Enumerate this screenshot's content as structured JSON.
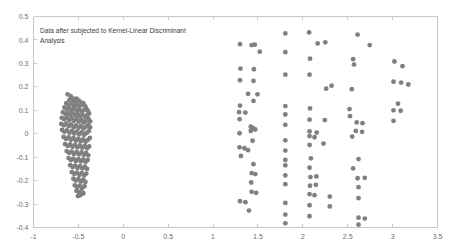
{
  "chart_data": {
    "type": "scatter",
    "title": "",
    "annotation": "Data after subjected to Kernel-Linear Discriminant Analysis",
    "annotation_line1": "Data after subjected to Kernel-Linear Discriminant",
    "annotation_line2": "Analysis",
    "xlabel": "",
    "ylabel": "",
    "xlim": [
      -1,
      3.5
    ],
    "ylim": [
      -0.4,
      0.5
    ],
    "xticks": [
      -1,
      -0.5,
      0,
      0.5,
      1,
      1.5,
      2,
      2.5,
      3,
      3.5
    ],
    "xticklabels": [
      "-1",
      "-0.5",
      "0",
      "0.5",
      "1",
      "1.5",
      "2",
      "2.5",
      "3",
      "3.5"
    ],
    "yticks": [
      -0.4,
      -0.3,
      -0.2,
      -0.1,
      0,
      0.1,
      0.2,
      0.3,
      0.4,
      0.5
    ],
    "yticklabels": [
      "-0.4",
      "-0.3",
      "-0.2",
      "-0.1",
      "0",
      "0.1",
      "0.2",
      "0.3",
      "0.4",
      "0.5"
    ],
    "grid": false,
    "legend": false,
    "marker_color": "#808080",
    "marker_size": 2.4,
    "frame_color": "#c8c8c8",
    "background_color": "#ffffff",
    "series": [
      {
        "name": "class-1-dense-cluster",
        "color": "#808080",
        "points": [
          [
            -0.62,
            0.168
          ],
          [
            -0.585,
            0.16
          ],
          [
            -0.56,
            0.15
          ],
          [
            -0.6,
            0.143
          ],
          [
            -0.545,
            0.138
          ],
          [
            -0.52,
            0.15
          ],
          [
            -0.495,
            0.141
          ],
          [
            -0.47,
            0.133
          ],
          [
            -0.635,
            0.13
          ],
          [
            -0.61,
            0.122
          ],
          [
            -0.575,
            0.128
          ],
          [
            -0.55,
            0.118
          ],
          [
            -0.52,
            0.126
          ],
          [
            -0.495,
            0.117
          ],
          [
            -0.468,
            0.122
          ],
          [
            -0.445,
            0.13
          ],
          [
            -0.425,
            0.118
          ],
          [
            -0.655,
            0.112
          ],
          [
            -0.628,
            0.105
          ],
          [
            -0.6,
            0.11
          ],
          [
            -0.572,
            0.1
          ],
          [
            -0.545,
            0.108
          ],
          [
            -0.518,
            0.098
          ],
          [
            -0.492,
            0.104
          ],
          [
            -0.465,
            0.096
          ],
          [
            -0.44,
            0.101
          ],
          [
            -0.415,
            0.109
          ],
          [
            -0.395,
            0.098
          ],
          [
            -0.672,
            0.092
          ],
          [
            -0.645,
            0.085
          ],
          [
            -0.618,
            0.09
          ],
          [
            -0.59,
            0.08
          ],
          [
            -0.563,
            0.087
          ],
          [
            -0.536,
            0.078
          ],
          [
            -0.508,
            0.083
          ],
          [
            -0.482,
            0.075
          ],
          [
            -0.455,
            0.081
          ],
          [
            -0.428,
            0.072
          ],
          [
            -0.402,
            0.079
          ],
          [
            -0.382,
            0.087
          ],
          [
            -0.685,
            0.068
          ],
          [
            -0.658,
            0.062
          ],
          [
            -0.63,
            0.07
          ],
          [
            -0.602,
            0.058
          ],
          [
            -0.575,
            0.065
          ],
          [
            -0.548,
            0.055
          ],
          [
            -0.52,
            0.062
          ],
          [
            -0.494,
            0.052
          ],
          [
            -0.466,
            0.058
          ],
          [
            -0.44,
            0.048
          ],
          [
            -0.412,
            0.056
          ],
          [
            -0.388,
            0.064
          ],
          [
            -0.368,
            0.053
          ],
          [
            -0.69,
            0.042
          ],
          [
            -0.662,
            0.036
          ],
          [
            -0.635,
            0.044
          ],
          [
            -0.608,
            0.032
          ],
          [
            -0.58,
            0.04
          ],
          [
            -0.552,
            0.028
          ],
          [
            -0.525,
            0.036
          ],
          [
            -0.498,
            0.025
          ],
          [
            -0.47,
            0.033
          ],
          [
            -0.443,
            0.022
          ],
          [
            -0.416,
            0.03
          ],
          [
            -0.39,
            0.038
          ],
          [
            -0.37,
            0.027
          ],
          [
            -0.682,
            0.016
          ],
          [
            -0.655,
            0.008
          ],
          [
            -0.628,
            0.014
          ],
          [
            -0.6,
            0.004
          ],
          [
            -0.572,
            0.012
          ],
          [
            -0.545,
            0.001
          ],
          [
            -0.518,
            0.009
          ],
          [
            -0.492,
            -0.002
          ],
          [
            -0.464,
            0.006
          ],
          [
            -0.437,
            -0.005
          ],
          [
            -0.41,
            0.003
          ],
          [
            -0.384,
            0.011
          ],
          [
            -0.665,
            -0.014
          ],
          [
            -0.638,
            -0.022
          ],
          [
            -0.61,
            -0.016
          ],
          [
            -0.583,
            -0.026
          ],
          [
            -0.556,
            -0.018
          ],
          [
            -0.528,
            -0.029
          ],
          [
            -0.5,
            -0.021
          ],
          [
            -0.474,
            -0.032
          ],
          [
            -0.447,
            -0.024
          ],
          [
            -0.42,
            -0.034
          ],
          [
            -0.394,
            -0.026
          ],
          [
            -0.372,
            -0.018
          ],
          [
            -0.648,
            -0.044
          ],
          [
            -0.62,
            -0.052
          ],
          [
            -0.592,
            -0.046
          ],
          [
            -0.565,
            -0.056
          ],
          [
            -0.538,
            -0.048
          ],
          [
            -0.51,
            -0.058
          ],
          [
            -0.484,
            -0.05
          ],
          [
            -0.457,
            -0.06
          ],
          [
            -0.43,
            -0.052
          ],
          [
            -0.404,
            -0.062
          ],
          [
            -0.38,
            -0.054
          ],
          [
            -0.63,
            -0.074
          ],
          [
            -0.602,
            -0.082
          ],
          [
            -0.575,
            -0.076
          ],
          [
            -0.548,
            -0.086
          ],
          [
            -0.52,
            -0.078
          ],
          [
            -0.493,
            -0.088
          ],
          [
            -0.466,
            -0.08
          ],
          [
            -0.44,
            -0.09
          ],
          [
            -0.414,
            -0.082
          ],
          [
            -0.39,
            -0.092
          ],
          [
            -0.61,
            -0.104
          ],
          [
            -0.583,
            -0.112
          ],
          [
            -0.556,
            -0.106
          ],
          [
            -0.528,
            -0.116
          ],
          [
            -0.5,
            -0.108
          ],
          [
            -0.473,
            -0.118
          ],
          [
            -0.446,
            -0.11
          ],
          [
            -0.42,
            -0.12
          ],
          [
            -0.396,
            -0.112
          ],
          [
            -0.592,
            -0.134
          ],
          [
            -0.564,
            -0.142
          ],
          [
            -0.537,
            -0.136
          ],
          [
            -0.51,
            -0.146
          ],
          [
            -0.482,
            -0.138
          ],
          [
            -0.455,
            -0.148
          ],
          [
            -0.428,
            -0.14
          ],
          [
            -0.404,
            -0.15
          ],
          [
            -0.572,
            -0.164
          ],
          [
            -0.545,
            -0.172
          ],
          [
            -0.518,
            -0.166
          ],
          [
            -0.49,
            -0.176
          ],
          [
            -0.463,
            -0.168
          ],
          [
            -0.436,
            -0.178
          ],
          [
            -0.412,
            -0.17
          ],
          [
            -0.556,
            -0.192
          ],
          [
            -0.528,
            -0.2
          ],
          [
            -0.5,
            -0.194
          ],
          [
            -0.473,
            -0.204
          ],
          [
            -0.446,
            -0.196
          ],
          [
            -0.422,
            -0.206
          ],
          [
            -0.54,
            -0.22
          ],
          [
            -0.512,
            -0.228
          ],
          [
            -0.485,
            -0.222
          ],
          [
            -0.458,
            -0.232
          ],
          [
            -0.432,
            -0.224
          ],
          [
            -0.52,
            -0.244
          ],
          [
            -0.494,
            -0.25
          ],
          [
            -0.468,
            -0.246
          ],
          [
            -0.444,
            -0.254
          ],
          [
            -0.505,
            -0.266
          ],
          [
            -0.478,
            -0.262
          ]
        ]
      },
      {
        "name": "class-2-sparse-cluster",
        "color": "#808080",
        "points": [
          [
            1.805,
            0.428
          ],
          [
            2.07,
            0.432
          ],
          [
            2.61,
            0.423
          ],
          [
            1.3,
            0.382
          ],
          [
            1.43,
            0.378
          ],
          [
            1.465,
            0.38
          ],
          [
            2.165,
            0.385
          ],
          [
            2.25,
            0.39
          ],
          [
            2.745,
            0.378
          ],
          [
            1.52,
            0.35
          ],
          [
            1.805,
            0.348
          ],
          [
            2.08,
            0.32
          ],
          [
            2.56,
            0.318
          ],
          [
            3.02,
            0.308
          ],
          [
            2.57,
            0.295
          ],
          [
            3.11,
            0.288
          ],
          [
            1.305,
            0.278
          ],
          [
            1.455,
            0.275
          ],
          [
            1.805,
            0.252
          ],
          [
            2.075,
            0.252
          ],
          [
            1.3,
            0.228
          ],
          [
            1.45,
            0.225
          ],
          [
            3.01,
            0.222
          ],
          [
            3.095,
            0.218
          ],
          [
            3.175,
            0.21
          ],
          [
            2.32,
            0.205
          ],
          [
            2.26,
            0.192
          ],
          [
            2.545,
            0.19
          ],
          [
            1.39,
            0.17
          ],
          [
            1.495,
            0.168
          ],
          [
            1.45,
            0.14
          ],
          [
            1.3,
            0.12
          ],
          [
            1.805,
            0.118
          ],
          [
            3.06,
            0.128
          ],
          [
            2.08,
            0.108
          ],
          [
            2.52,
            0.105
          ],
          [
            3.01,
            0.1
          ],
          [
            3.09,
            0.098
          ],
          [
            1.29,
            0.092
          ],
          [
            1.36,
            0.09
          ],
          [
            1.805,
            0.082
          ],
          [
            2.525,
            0.075
          ],
          [
            1.295,
            0.062
          ],
          [
            2.075,
            0.06
          ],
          [
            2.245,
            0.058
          ],
          [
            3.01,
            0.055
          ],
          [
            2.6,
            0.048
          ],
          [
            2.665,
            0.045
          ],
          [
            1.805,
            0.038
          ],
          [
            1.42,
            0.03
          ],
          [
            1.445,
            0.025
          ],
          [
            1.42,
            0.012
          ],
          [
            1.47,
            0.018
          ],
          [
            2.075,
            0.01
          ],
          [
            2.155,
            0.005
          ],
          [
            2.59,
            0.012
          ],
          [
            2.66,
            0.008
          ],
          [
            1.295,
            0.002
          ],
          [
            2.075,
            -0.01
          ],
          [
            2.13,
            -0.015
          ],
          [
            2.55,
            -0.012
          ],
          [
            1.44,
            -0.03
          ],
          [
            1.805,
            -0.028
          ],
          [
            2.075,
            -0.048
          ],
          [
            2.23,
            -0.042
          ],
          [
            1.295,
            -0.058
          ],
          [
            1.35,
            -0.062
          ],
          [
            1.39,
            -0.07
          ],
          [
            1.805,
            -0.072
          ],
          [
            1.31,
            -0.095
          ],
          [
            1.805,
            -0.112
          ],
          [
            2.09,
            -0.105
          ],
          [
            2.62,
            -0.108
          ],
          [
            1.45,
            -0.13
          ],
          [
            1.805,
            -0.135
          ],
          [
            2.075,
            -0.145
          ],
          [
            2.56,
            -0.148
          ],
          [
            1.43,
            -0.168
          ],
          [
            1.47,
            -0.172
          ],
          [
            1.805,
            -0.178
          ],
          [
            2.085,
            -0.185
          ],
          [
            2.15,
            -0.182
          ],
          [
            2.61,
            -0.19
          ],
          [
            2.69,
            -0.188
          ],
          [
            1.425,
            -0.208
          ],
          [
            1.805,
            -0.215
          ],
          [
            2.08,
            -0.222
          ],
          [
            2.145,
            -0.218
          ],
          [
            2.62,
            -0.228
          ],
          [
            1.43,
            -0.248
          ],
          [
            1.48,
            -0.252
          ],
          [
            2.075,
            -0.258
          ],
          [
            2.13,
            -0.262
          ],
          [
            2.3,
            -0.268
          ],
          [
            2.62,
            -0.275
          ],
          [
            1.3,
            -0.288
          ],
          [
            1.36,
            -0.292
          ],
          [
            1.805,
            -0.295
          ],
          [
            2.075,
            -0.305
          ],
          [
            2.3,
            -0.31
          ],
          [
            1.4,
            -0.328
          ],
          [
            1.805,
            -0.345
          ],
          [
            2.075,
            -0.352
          ],
          [
            2.62,
            -0.358
          ],
          [
            2.69,
            -0.362
          ],
          [
            1.805,
            -0.382
          ],
          [
            2.62,
            -0.388
          ]
        ]
      }
    ]
  }
}
